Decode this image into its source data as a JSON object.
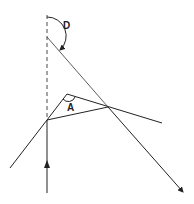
{
  "diagram": {
    "type": "prism-deviation",
    "labels": {
      "deviation": "D",
      "apex_angle": "A"
    },
    "colors": {
      "line": "#222222",
      "background": "#ffffff"
    },
    "elements": [
      "dashed-normal-line",
      "prism-triangle",
      "incident-ray",
      "emergent-ray",
      "deviation-arc",
      "apex-angle-arc"
    ]
  }
}
